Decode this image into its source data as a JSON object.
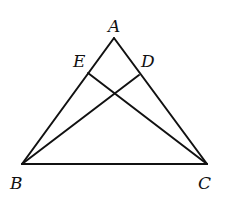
{
  "diagram": {
    "type": "geometry-triangle",
    "points": {
      "A": {
        "x": 114,
        "y": 38
      },
      "B": {
        "x": 22,
        "y": 164
      },
      "C": {
        "x": 207,
        "y": 164
      },
      "E": {
        "x": 88,
        "y": 73
      },
      "D": {
        "x": 139,
        "y": 75
      }
    },
    "segments": [
      {
        "from": "A",
        "to": "B"
      },
      {
        "from": "A",
        "to": "C"
      },
      {
        "from": "B",
        "to": "C"
      },
      {
        "from": "B",
        "to": "D"
      },
      {
        "from": "C",
        "to": "E"
      }
    ],
    "labels": {
      "A": "A",
      "B": "B",
      "C": "C",
      "D": "D",
      "E": "E"
    },
    "stroke_color": "#111111",
    "background": "#ffffff"
  }
}
